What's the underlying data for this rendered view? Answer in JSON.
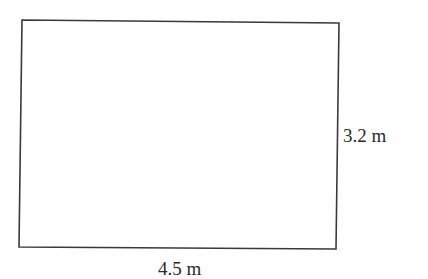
{
  "diagram": {
    "shape": "rectangle",
    "stroke_color": "#3a3a3a",
    "background": "#ffffff",
    "width_label": "4.5 m",
    "height_label": "3.2 m"
  }
}
